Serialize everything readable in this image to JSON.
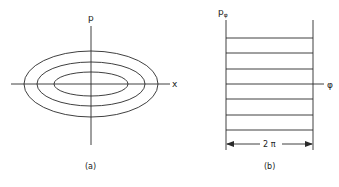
{
  "panel_a": {
    "caption": "(a)",
    "y_axis_label": "p",
    "x_axis_label": "x",
    "contours": [
      "outer-ellipse",
      "middle-ellipse",
      "inner-ellipse"
    ]
  },
  "panel_b": {
    "caption": "(b)",
    "y_axis_label": "p",
    "y_axis_subscript": "φ",
    "x_axis_label": "φ",
    "period_label": "2 π",
    "horizontal_lines": 7
  }
}
